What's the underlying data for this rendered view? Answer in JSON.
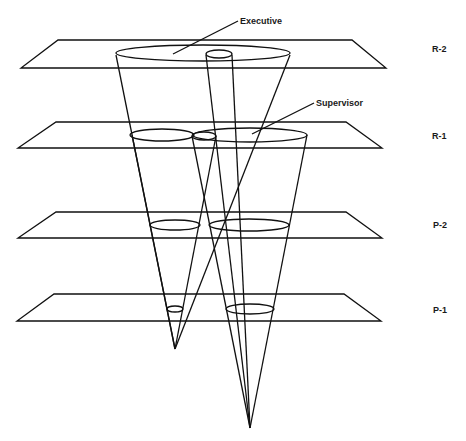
{
  "diagram": {
    "type": "cone-plane intersection",
    "levels": [
      {
        "id": "R-2",
        "label": "R-2"
      },
      {
        "id": "R-1",
        "label": "R-1"
      },
      {
        "id": "P-2",
        "label": "P-2"
      },
      {
        "id": "P-1",
        "label": "P-1"
      }
    ],
    "callouts": {
      "executive": "Executive",
      "supervisor": "Supervisor"
    },
    "colors": {
      "line": "#111111",
      "background": "#ffffff"
    }
  }
}
